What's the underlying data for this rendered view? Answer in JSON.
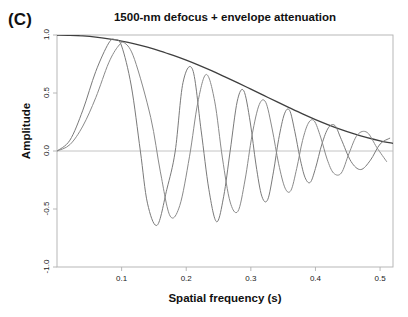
{
  "figure": {
    "panel_label": "(C)",
    "background_color": "#ffffff"
  },
  "chart_data": {
    "type": "line",
    "title": "1500-nm defocus + envelope attenuation",
    "xlabel": "Spatial frequency (s)",
    "ylabel": "Amplitude",
    "xlim": [
      0.0,
      0.52
    ],
    "ylim": [
      -1.0,
      1.0
    ],
    "xticks": [
      0.1,
      0.2,
      0.3,
      0.4,
      0.5
    ],
    "xtick_labels": [
      "0.1",
      "0.2",
      "0.3",
      "0.4",
      "0.5"
    ],
    "yticks": [
      -1.0,
      -0.5,
      0.0,
      0.5,
      1.0
    ],
    "ytick_labels": [
      "-1.0",
      "-0.5",
      "0.0",
      "0.5",
      "1.0"
    ],
    "grid": false,
    "legend": "none",
    "zero_line": true,
    "zero_line_color": "#bdbdbd",
    "frame_color": "#b0b0b0",
    "series": [
      {
        "name": "envelope",
        "color": "#3f3f3f",
        "width": 1.3,
        "description": "Smooth monotonically decaying envelope from 1.0 at origin toward ~0.05",
        "x": [
          0.0,
          0.02,
          0.04,
          0.06,
          0.08,
          0.1,
          0.12,
          0.14,
          0.16,
          0.18,
          0.2,
          0.22,
          0.24,
          0.26,
          0.28,
          0.3,
          0.32,
          0.34,
          0.36,
          0.38,
          0.4,
          0.42,
          0.44,
          0.46,
          0.48,
          0.5,
          0.52
        ],
        "y": [
          1.0,
          0.998,
          0.992,
          0.982,
          0.967,
          0.948,
          0.924,
          0.895,
          0.862,
          0.824,
          0.783,
          0.738,
          0.69,
          0.639,
          0.587,
          0.533,
          0.479,
          0.425,
          0.372,
          0.32,
          0.271,
          0.226,
          0.184,
          0.147,
          0.115,
          0.088,
          0.066
        ]
      },
      {
        "name": "ctf-curve-1",
        "color": "#7a7a7a",
        "width": 1.0,
        "description": "Chirped oscillation, first peak near 0.090 at amplitude 0.96, first zero near 0.129, deepest trough -0.64 at 0.155",
        "chirp_coefficient": 38.0,
        "x": [
          0.0,
          0.02,
          0.04,
          0.06,
          0.08,
          0.09,
          0.1,
          0.115,
          0.129,
          0.14,
          0.155,
          0.17,
          0.183,
          0.195,
          0.21,
          0.223,
          0.235,
          0.247,
          0.258,
          0.268,
          0.279,
          0.289,
          0.299,
          0.308,
          0.317,
          0.326,
          0.335,
          0.343,
          0.352,
          0.36,
          0.368,
          0.376,
          0.384,
          0.392,
          0.4,
          0.41,
          0.42,
          0.43,
          0.44,
          0.455,
          0.47,
          0.485,
          0.5,
          0.515
        ],
        "y": [
          0.0,
          0.093,
          0.352,
          0.686,
          0.93,
          0.96,
          0.905,
          0.56,
          0.0,
          -0.45,
          -0.64,
          -0.33,
          0.0,
          0.59,
          0.7,
          0.18,
          -0.33,
          -0.61,
          -0.39,
          0.0,
          0.43,
          0.52,
          0.25,
          -0.12,
          -0.39,
          -0.42,
          -0.18,
          0.1,
          0.32,
          0.35,
          0.17,
          -0.06,
          -0.23,
          -0.27,
          -0.15,
          0.06,
          0.2,
          0.22,
          0.1,
          -0.09,
          -0.16,
          -0.08,
          0.06,
          0.11
        ]
      },
      {
        "name": "ctf-curve-2",
        "color": "#8a8a8a",
        "width": 1.0,
        "description": "Chirped oscillation with slightly lower frequency; first peak near 0.105 at amplitude 0.93, first zero near 0.145, trough -0.56 at 0.175",
        "chirp_coefficient": 30.0,
        "x": [
          0.0,
          0.02,
          0.04,
          0.06,
          0.08,
          0.095,
          0.105,
          0.12,
          0.145,
          0.16,
          0.175,
          0.19,
          0.205,
          0.218,
          0.231,
          0.244,
          0.256,
          0.268,
          0.28,
          0.291,
          0.302,
          0.313,
          0.323,
          0.333,
          0.343,
          0.353,
          0.362,
          0.371,
          0.38,
          0.389,
          0.398,
          0.408,
          0.418,
          0.428,
          0.44,
          0.452,
          0.465,
          0.48,
          0.495,
          0.51
        ],
        "y": [
          0.0,
          0.055,
          0.215,
          0.46,
          0.76,
          0.905,
          0.93,
          0.79,
          0.29,
          -0.18,
          -0.56,
          -0.47,
          -0.05,
          0.42,
          0.66,
          0.43,
          -0.06,
          -0.44,
          -0.52,
          -0.25,
          0.14,
          0.4,
          0.42,
          0.19,
          -0.11,
          -0.32,
          -0.34,
          -0.15,
          0.09,
          0.24,
          0.26,
          0.12,
          -0.07,
          -0.19,
          -0.19,
          -0.02,
          0.14,
          0.16,
          0.03,
          -0.09
        ]
      }
    ]
  },
  "axes": {
    "plot_left_px": 57,
    "plot_right_px": 393,
    "plot_top_px": 35,
    "plot_bottom_px": 267
  }
}
